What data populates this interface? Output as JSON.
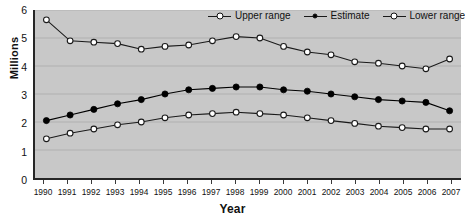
{
  "chart_data": {
    "type": "line",
    "title": "",
    "xlabel": "Year",
    "ylabel": "Millions",
    "ylim": [
      0,
      6
    ],
    "yticks": [
      0,
      1,
      2,
      3,
      4,
      5,
      6
    ],
    "grid": true,
    "legend_position": "top-right",
    "categories": [
      "1990",
      "1991",
      "1992",
      "1993",
      "1994",
      "1995",
      "1996",
      "1997",
      "1998",
      "1999",
      "2000",
      "2001",
      "2002",
      "2003",
      "2004",
      "2005",
      "2006",
      "2007"
    ],
    "series": [
      {
        "name": "Upper range",
        "marker": "open-circle",
        "color": "#1a1a1a",
        "values": [
          5.65,
          4.9,
          4.85,
          4.8,
          4.6,
          4.7,
          4.75,
          4.9,
          5.05,
          5.0,
          4.7,
          4.5,
          4.4,
          4.15,
          4.1,
          4.0,
          3.9,
          4.25
        ]
      },
      {
        "name": "Estimate",
        "marker": "filled-circle",
        "color": "#000000",
        "values": [
          2.05,
          2.25,
          2.45,
          2.65,
          2.8,
          3.0,
          3.15,
          3.2,
          3.25,
          3.25,
          3.15,
          3.1,
          3.0,
          2.9,
          2.8,
          2.75,
          2.7,
          2.4
        ]
      },
      {
        "name": "Lower range",
        "marker": "open-circle",
        "color": "#1a1a1a",
        "values": [
          1.4,
          1.6,
          1.75,
          1.9,
          2.0,
          2.15,
          2.25,
          2.3,
          2.35,
          2.3,
          2.25,
          2.15,
          2.05,
          1.95,
          1.85,
          1.8,
          1.75,
          1.75
        ]
      }
    ]
  },
  "legend": {
    "items": [
      {
        "label": "Upper range",
        "marker": "open-circle"
      },
      {
        "label": "Estimate",
        "marker": "filled-circle"
      },
      {
        "label": "Lower range",
        "marker": "open-circle"
      }
    ]
  },
  "axes": {
    "y_title": "Millions",
    "x_title": "Year"
  },
  "colors": {
    "plot_background": "#c8c8c8",
    "page_background": "#ffffff",
    "axis": "#262626",
    "gridline": "#b0b0b0",
    "line": "#1a1a1a",
    "marker_open_fill": "#ffffff",
    "marker_filled_fill": "#000000"
  },
  "title_strip": ""
}
